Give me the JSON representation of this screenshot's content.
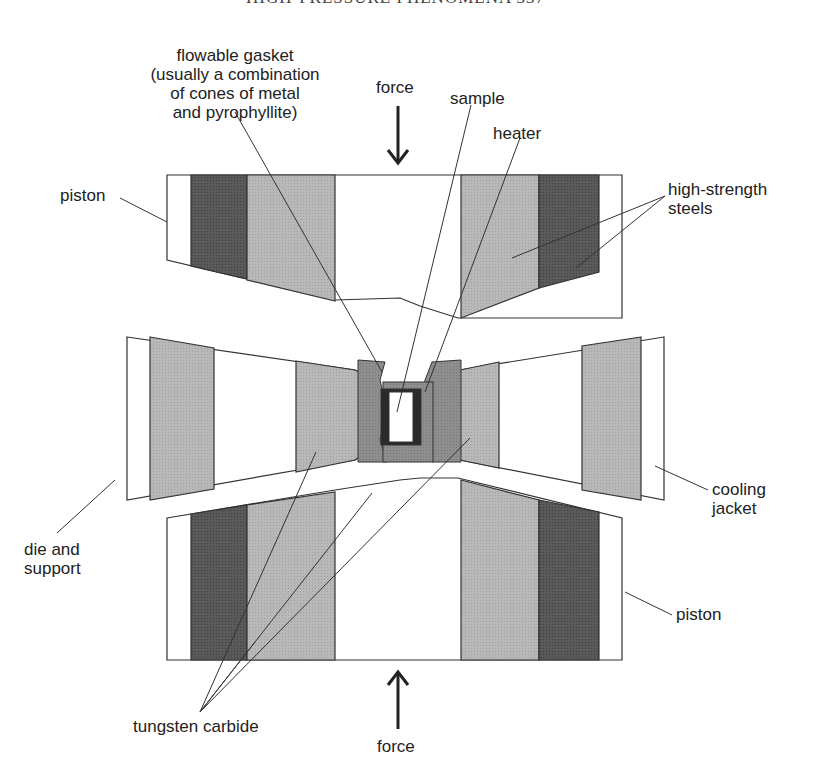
{
  "page": {
    "running_header": "HIGH-PRESSURE PHENOMENA   337"
  },
  "diagram": {
    "labels": {
      "gasket": [
        "flowable gasket",
        "(usually a combination",
        "of cones of metal",
        "and pyrophyllite)"
      ],
      "force_top": "force",
      "sample": "sample",
      "heater": "heater",
      "piston_top": "piston",
      "high_strength_steels": [
        "high-strength",
        "steels"
      ],
      "die_and_support": [
        "die and",
        "support"
      ],
      "cooling_jacket": [
        "cooling",
        "jacket"
      ],
      "piston_bottom": "piston",
      "tungsten_carbide": "tungsten carbide",
      "force_bottom": "force"
    },
    "colors": {
      "outline": "#333333",
      "light_fill": "#b3b3b3",
      "dark_fill": "#555555",
      "gasket_fill": "#8a8a8a",
      "heater_fill": "#2a2a2a",
      "white": "#ffffff"
    }
  }
}
